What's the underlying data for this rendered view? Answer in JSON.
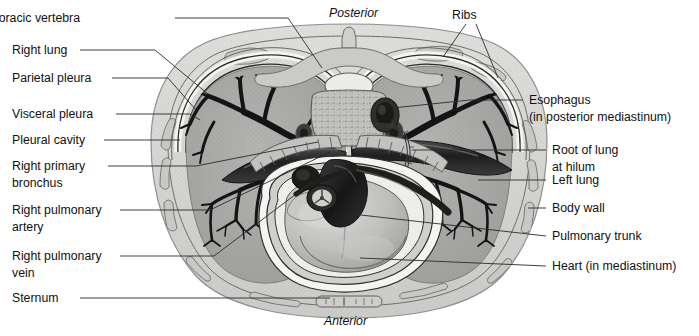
{
  "figure": {
    "type": "anatomical-cross-section",
    "orientation_labels": [
      {
        "id": "posterior",
        "text": "Posterior",
        "style": "italic",
        "position": "top-center"
      },
      {
        "id": "anterior",
        "text": "Anterior",
        "style": "italic",
        "position": "bottom-center"
      }
    ],
    "labels_left": [
      {
        "id": "thoracic-vertebra",
        "text": "Thoracic vertebra",
        "lines": [
          "Thoracic vertebra"
        ]
      },
      {
        "id": "right-lung",
        "text": "Right lung",
        "lines": [
          "Right lung"
        ]
      },
      {
        "id": "parietal-pleura",
        "text": "Parietal pleura",
        "lines": [
          "Parietal pleura"
        ]
      },
      {
        "id": "visceral-pleura",
        "text": "Visceral pleura",
        "lines": [
          "Visceral pleura"
        ]
      },
      {
        "id": "pleural-cavity",
        "text": "Pleural cavity",
        "lines": [
          "Pleural cavity"
        ]
      },
      {
        "id": "right-primary-bronchus",
        "text": "Right primary bronchus",
        "lines": [
          "Right primary",
          "bronchus"
        ]
      },
      {
        "id": "right-pulmonary-artery",
        "text": "Right pulmonary artery",
        "lines": [
          "Right pulmonary",
          "artery"
        ]
      },
      {
        "id": "right-pulmonary-vein",
        "text": "Right pulmonary vein",
        "lines": [
          "Right pulmonary",
          "vein"
        ]
      },
      {
        "id": "sternum",
        "text": "Sternum",
        "lines": [
          "Sternum"
        ]
      }
    ],
    "labels_right": [
      {
        "id": "ribs",
        "text": "Ribs",
        "lines": [
          "Ribs"
        ]
      },
      {
        "id": "esophagus",
        "text": "Esophagus (in posterior mediastinum)",
        "lines": [
          "Esophagus",
          "(in posterior mediastinum)"
        ]
      },
      {
        "id": "root-of-lung",
        "text": "Root of lung at hilum",
        "lines": [
          "Root of lung",
          "at hilum"
        ]
      },
      {
        "id": "left-lung",
        "text": "Left lung",
        "lines": [
          "Left lung"
        ]
      },
      {
        "id": "body-wall",
        "text": "Body wall",
        "lines": [
          "Body wall"
        ]
      },
      {
        "id": "pulmonary-trunk",
        "text": "Pulmonary trunk",
        "lines": [
          "Pulmonary trunk"
        ]
      },
      {
        "id": "heart",
        "text": "Heart (in mediastinum)",
        "lines": [
          "Heart (in mediastinum)"
        ]
      }
    ]
  },
  "text": {
    "posterior": "Posterior",
    "anterior": "Anterior",
    "ribs": "Ribs",
    "thoracic_vertebra": "Thoracic vertebra",
    "right_lung": "Right lung",
    "parietal_pleura": "Parietal pleura",
    "visceral_pleura": "Visceral pleura",
    "pleural_cavity": "Pleural cavity",
    "right_primary_bronchus_l1": "Right primary",
    "right_primary_bronchus_l2": "bronchus",
    "right_pulmonary_artery_l1": "Right pulmonary",
    "right_pulmonary_artery_l2": "artery",
    "right_pulmonary_vein_l1": "Right pulmonary",
    "right_pulmonary_vein_l2": "vein",
    "sternum": "Sternum",
    "esophagus_l1": "Esophagus",
    "esophagus_l2": "(in posterior mediastinum)",
    "root_of_lung_l1": "Root of lung",
    "root_of_lung_l2": "at hilum",
    "left_lung": "Left lung",
    "body_wall": "Body wall",
    "pulmonary_trunk": "Pulmonary trunk",
    "heart": "Heart (in mediastinum)"
  },
  "colors": {
    "background": "#ffffff",
    "text": "#111111",
    "leader_line": "#2b2b2b",
    "body_wall_fill": "#d6d6d4",
    "body_wall_edge": "#9a9a98",
    "lung_fill": "#a9a9a7",
    "lung_speckle": "#8e8e8c",
    "pleural_cavity": "#efefed",
    "bronchial_tree": "#1c1c1c",
    "vessel_dark": "#2a2a2a",
    "heart_fill": "#b9b9b7",
    "heart_highlight": "#d8d8d6",
    "vertebra_fill": "#c9c9c7",
    "vertebra_marrow": "#b0b0ae",
    "pericardium": "#f2f2f0",
    "rib_fill": "#c4c4c2"
  }
}
